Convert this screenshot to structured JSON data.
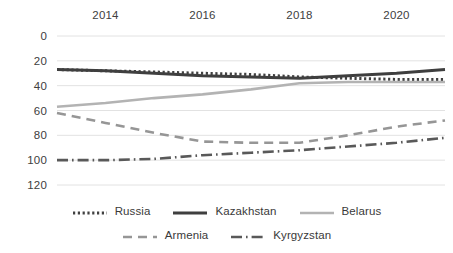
{
  "chart_data": {
    "type": "line",
    "title": "",
    "subtitle": "",
    "xlabel": "",
    "ylabel": "",
    "grid": true,
    "legend_position": "bottom",
    "x_axis_position": "top",
    "y_axis_inverted": true,
    "xlim": [
      2013,
      2021
    ],
    "ylim": [
      0,
      120
    ],
    "x": [
      2013,
      2014,
      2015,
      2016,
      2017,
      2018,
      2019,
      2020,
      2021
    ],
    "xticks": [
      "2014",
      "2016",
      "2018",
      "2020"
    ],
    "xtick_values": [
      2014,
      2016,
      2018,
      2020
    ],
    "yticks": [
      "0",
      "20",
      "40",
      "60",
      "80",
      "100",
      "120"
    ],
    "ytick_values": [
      0,
      20,
      40,
      60,
      80,
      100,
      120
    ],
    "series": [
      {
        "name": "Russia",
        "style": "dotted",
        "color": "#404040",
        "values": [
          27,
          28,
          29,
          30,
          31,
          33,
          34,
          35,
          35
        ]
      },
      {
        "name": "Kazakhstan",
        "style": "solid",
        "color": "#3f3f3f",
        "values": [
          27,
          28,
          30,
          32,
          33,
          34,
          32,
          30,
          27
        ]
      },
      {
        "name": "Belarus",
        "style": "solid-light",
        "color": "#b3b3b3",
        "values": [
          57,
          54,
          50,
          47,
          43,
          38,
          37,
          37,
          37
        ]
      },
      {
        "name": "Armenia",
        "style": "dashed",
        "color": "#969696",
        "values": [
          62,
          70,
          78,
          85,
          86,
          86,
          80,
          73,
          68
        ]
      },
      {
        "name": "Kyrgyzstan",
        "style": "dash-dot",
        "color": "#595959",
        "values": [
          100,
          100,
          99,
          96,
          94,
          92,
          89,
          86,
          82
        ]
      }
    ]
  },
  "legend": {
    "rows": [
      [
        {
          "label": "Russia",
          "swatch": "legend-swatch-russia"
        },
        {
          "label": "Kazakhstan",
          "swatch": "legend-swatch-kazakhstan"
        },
        {
          "label": "Belarus",
          "swatch": "legend-swatch-belarus"
        }
      ],
      [
        {
          "label": "Armenia",
          "swatch": "legend-swatch-armenia"
        },
        {
          "label": "Kyrgyzstan",
          "swatch": "legend-swatch-kyrgyzstan"
        }
      ]
    ]
  },
  "colors": {
    "gridline": "#e2e2e2",
    "axis_text": "#404040",
    "background": "#ffffff"
  }
}
